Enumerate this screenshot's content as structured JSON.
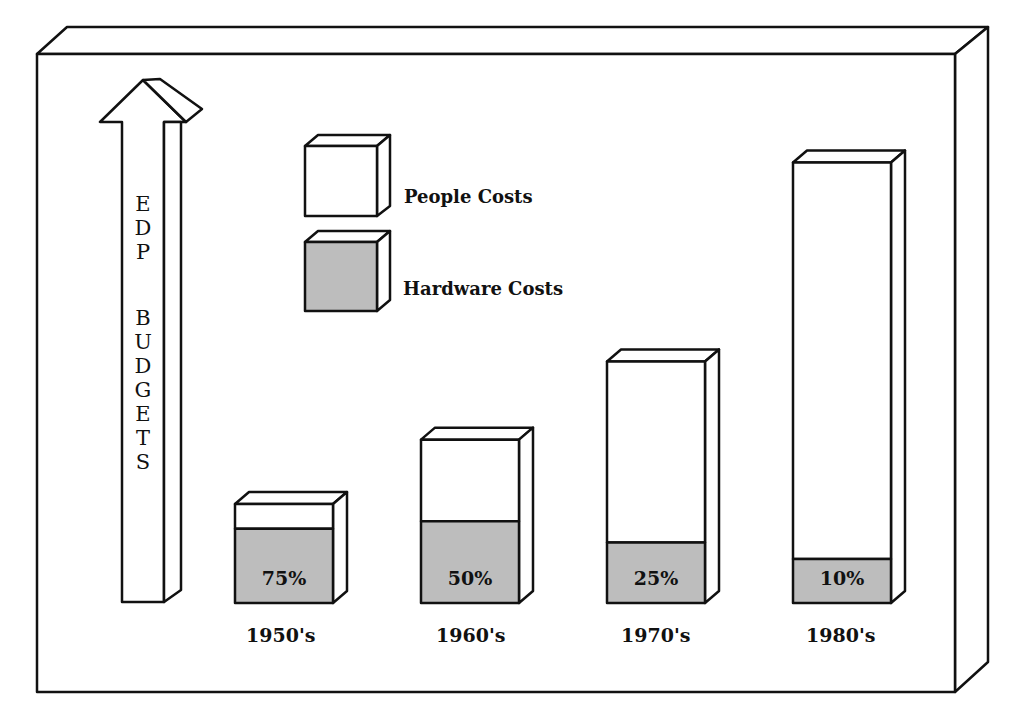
{
  "chart_data": {
    "type": "bar",
    "subtype": "stacked-3d",
    "title": "",
    "ylabel": "EDP BUDGETS",
    "xlabel": "",
    "categories": [
      "1950's",
      "1960's",
      "1970's",
      "1980's"
    ],
    "relative_total_height": [
      1.0,
      1.65,
      2.44,
      4.45
    ],
    "series": [
      {
        "name": "Hardware Costs",
        "values_pct": [
          75,
          50,
          25,
          10
        ],
        "color": "#bdbdbd"
      },
      {
        "name": "People Costs",
        "values_pct": [
          25,
          50,
          75,
          90
        ],
        "color": "#ffffff"
      }
    ],
    "data_labels": [
      "75%",
      "50%",
      "25%",
      "10%"
    ],
    "legend": {
      "position": "top-center",
      "entries": [
        "People Costs",
        "Hardware Costs"
      ]
    },
    "grid": false
  },
  "axis_arrow": {
    "letters_line1": [
      "E",
      "D",
      "P"
    ],
    "letters_line2": [
      "B",
      "U",
      "D",
      "G",
      "E",
      "T",
      "S"
    ]
  },
  "legend": {
    "people": "People Costs",
    "hardware": "Hardware Costs"
  },
  "colors": {
    "hardware_fill": "#bdbdbd",
    "people_fill": "#ffffff",
    "stroke": "#111111"
  }
}
